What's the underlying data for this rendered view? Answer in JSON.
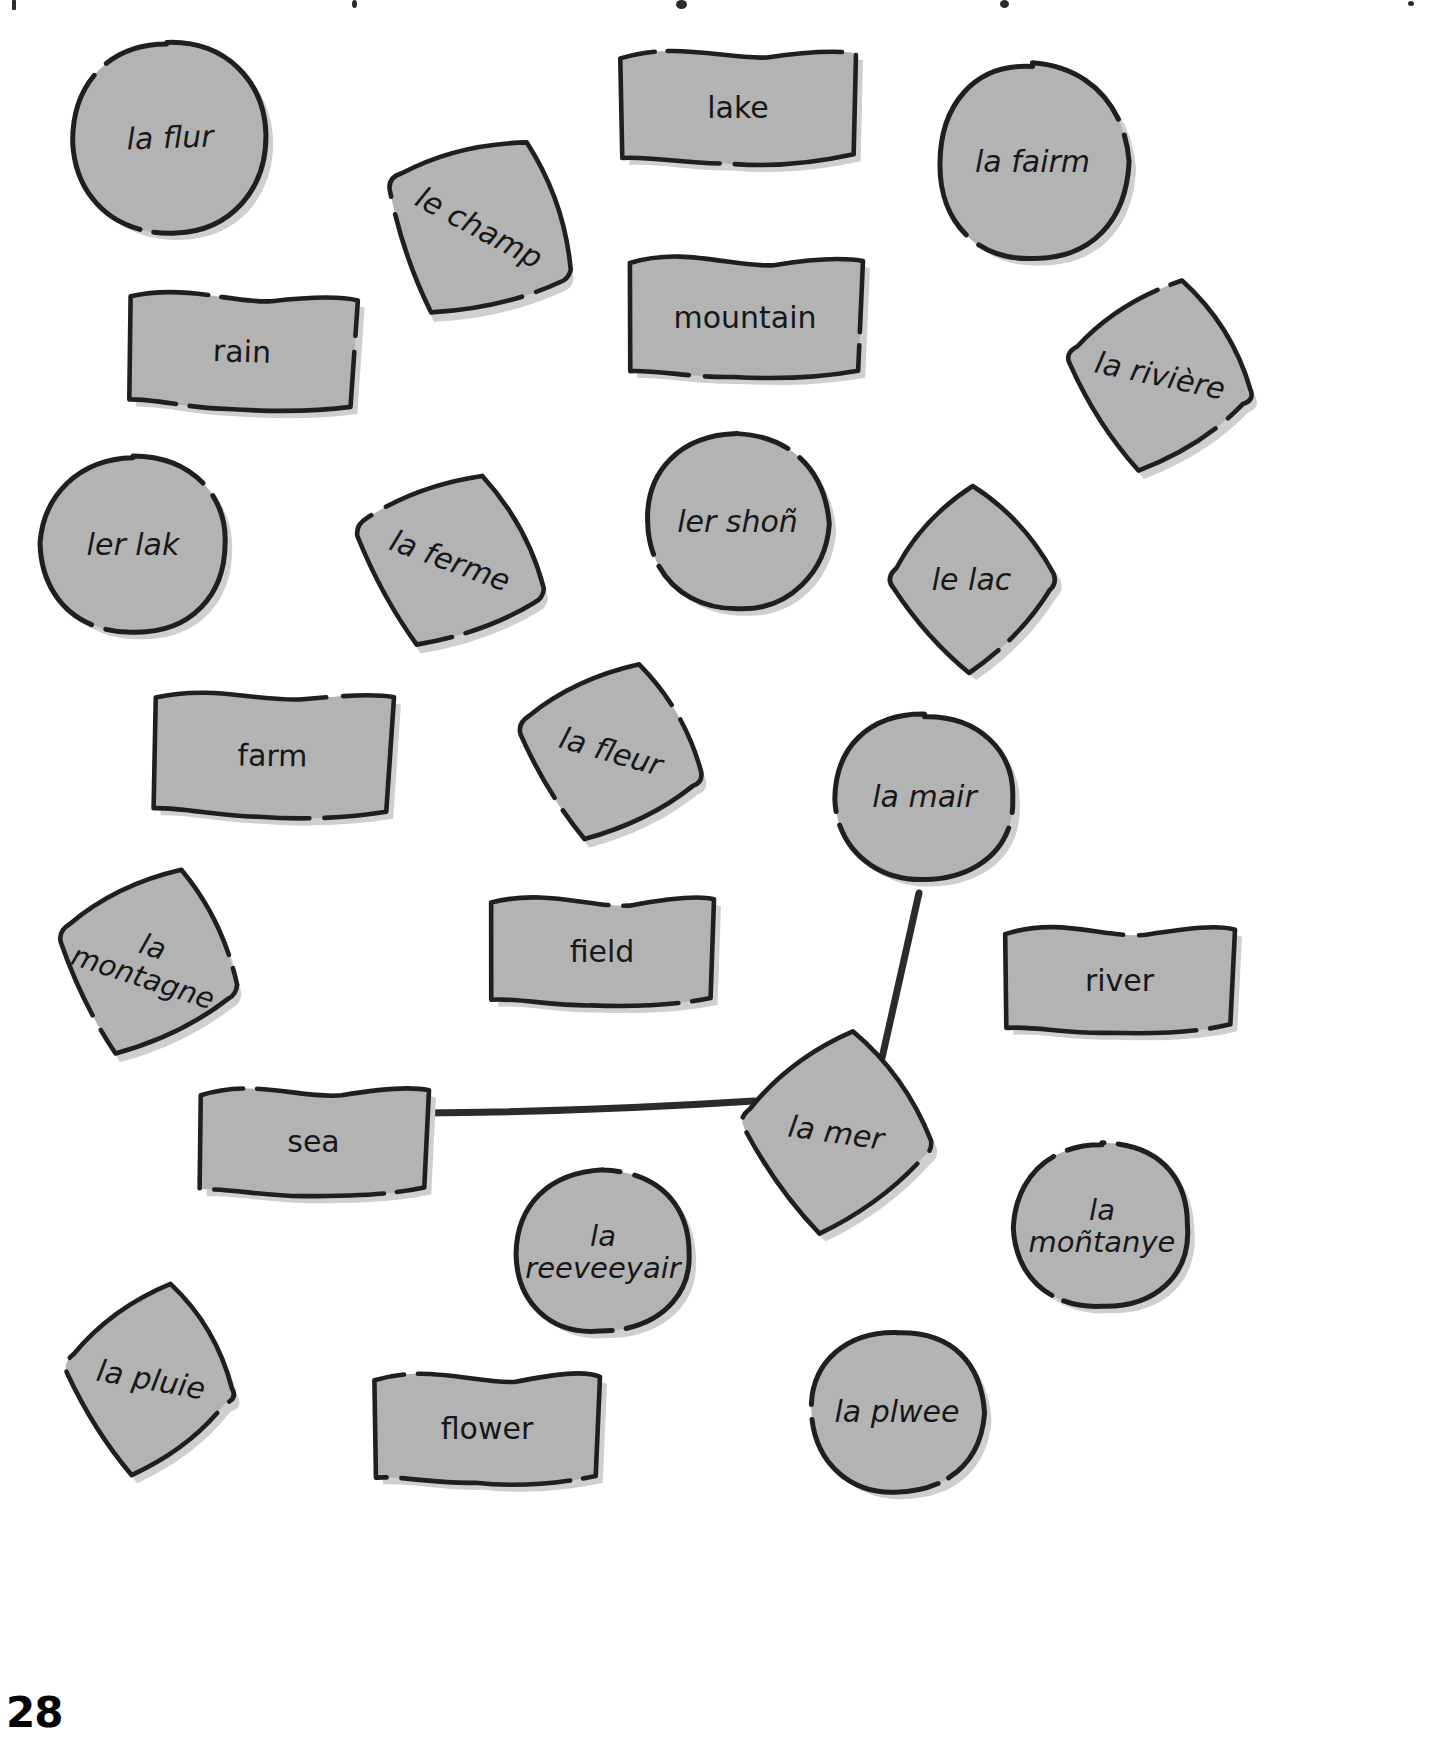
{
  "page": {
    "number": "28",
    "background_color": "#ffffff",
    "shape_fill": "#b3b3b3",
    "shape_stroke": "#1f1f1f",
    "shape_shadow": "#cfcfcf",
    "text_color": "#17171a",
    "link_color": "#2b2b2b"
  },
  "cards": [
    {
      "id": "la-flur",
      "label": "la flur",
      "lang": "fr",
      "shape": "circle",
      "x": 70,
      "y": 40,
      "w": 200,
      "h": 195,
      "rot": -2,
      "font": 30,
      "lines": 1
    },
    {
      "id": "lake",
      "label": "lake",
      "lang": "en",
      "shape": "flag",
      "x": 618,
      "y": 45,
      "w": 240,
      "h": 125,
      "rot": 0,
      "font": 30,
      "lines": 1
    },
    {
      "id": "la-fairm",
      "label": "la fairm",
      "lang": "fr",
      "shape": "circle",
      "x": 935,
      "y": 62,
      "w": 195,
      "h": 200,
      "rot": 0,
      "font": 30,
      "lines": 1
    },
    {
      "id": "le-champ",
      "label": "le champ",
      "lang": "fr",
      "shape": "diamond",
      "x": 374,
      "y": 128,
      "w": 210,
      "h": 200,
      "rot": 28,
      "font": 30,
      "lines": 1
    },
    {
      "id": "rain",
      "label": "rain",
      "lang": "en",
      "shape": "flag",
      "x": 126,
      "y": 288,
      "w": 232,
      "h": 128,
      "rot": 2,
      "font": 30,
      "lines": 1
    },
    {
      "id": "mountain",
      "label": "mountain",
      "lang": "en",
      "shape": "flag",
      "x": 625,
      "y": 252,
      "w": 240,
      "h": 132,
      "rot": 0,
      "font": 30,
      "lines": 1
    },
    {
      "id": "la-riviere",
      "label": "la rivière",
      "lang": "fr",
      "shape": "diamond",
      "x": 1060,
      "y": 276,
      "w": 200,
      "h": 200,
      "rot": 12,
      "font": 30,
      "lines": 1
    },
    {
      "id": "ler-lak",
      "label": "ler lak",
      "lang": "fr",
      "shape": "circle",
      "x": 38,
      "y": 455,
      "w": 190,
      "h": 180,
      "rot": 0,
      "font": 30,
      "lines": 1
    },
    {
      "id": "la-ferme",
      "label": "la ferme",
      "lang": "fr",
      "shape": "diamond",
      "x": 348,
      "y": 468,
      "w": 204,
      "h": 186,
      "rot": 20,
      "font": 30,
      "lines": 1
    },
    {
      "id": "ler-shon",
      "label": "ler shoñ",
      "lang": "fr",
      "shape": "circle",
      "x": 645,
      "y": 432,
      "w": 185,
      "h": 180,
      "rot": 0,
      "font": 30,
      "lines": 1
    },
    {
      "id": "le-lac",
      "label": "le lac",
      "lang": "fr",
      "shape": "diamond",
      "x": 884,
      "y": 484,
      "w": 175,
      "h": 192,
      "rot": 0,
      "font": 30,
      "lines": 1
    },
    {
      "id": "farm",
      "label": "farm",
      "lang": "en",
      "shape": "flag",
      "x": 150,
      "y": 688,
      "w": 245,
      "h": 135,
      "rot": 1,
      "font": 30,
      "lines": 1
    },
    {
      "id": "la-fleur",
      "label": "la fleur",
      "lang": "fr",
      "shape": "diamond",
      "x": 512,
      "y": 658,
      "w": 198,
      "h": 188,
      "rot": 16,
      "font": 30,
      "lines": 1
    },
    {
      "id": "la-mair",
      "label": "la mair",
      "lang": "fr",
      "shape": "circle",
      "x": 832,
      "y": 712,
      "w": 185,
      "h": 170,
      "rot": 0,
      "font": 30,
      "lines": 1
    },
    {
      "id": "la-montagne",
      "label": "la\nmontagne",
      "lang": "fr",
      "shape": "diamond",
      "x": 52,
      "y": 862,
      "w": 192,
      "h": 200,
      "rot": 18,
      "font": 29,
      "lines": 2
    },
    {
      "id": "field",
      "label": "field",
      "lang": "en",
      "shape": "flag",
      "x": 488,
      "y": 892,
      "w": 228,
      "h": 120,
      "rot": 0,
      "font": 30,
      "lines": 1
    },
    {
      "id": "river",
      "label": "river",
      "lang": "en",
      "shape": "flag",
      "x": 1002,
      "y": 922,
      "w": 235,
      "h": 118,
      "rot": 0,
      "font": 30,
      "lines": 1
    },
    {
      "id": "sea",
      "label": "sea",
      "lang": "en",
      "shape": "flag",
      "x": 196,
      "y": 1082,
      "w": 235,
      "h": 120,
      "rot": 0,
      "font": 30,
      "lines": 1
    },
    {
      "id": "la-mer",
      "label": "la mer",
      "lang": "fr",
      "shape": "diamond",
      "x": 736,
      "y": 1028,
      "w": 200,
      "h": 210,
      "rot": 8,
      "font": 30,
      "lines": 1
    },
    {
      "id": "la-montanye",
      "label": "la\nmoñtanye",
      "lang": "fr",
      "shape": "circle",
      "x": 1012,
      "y": 1142,
      "w": 180,
      "h": 168,
      "rot": 0,
      "font": 29,
      "lines": 2
    },
    {
      "id": "la-reeveeyair",
      "label": "la\nreeveeyair",
      "lang": "fr",
      "shape": "circle",
      "x": 512,
      "y": 1168,
      "w": 182,
      "h": 168,
      "rot": 0,
      "font": 29,
      "lines": 2
    },
    {
      "id": "la-pluie",
      "label": "la pluie",
      "lang": "fr",
      "shape": "diamond",
      "x": 60,
      "y": 1280,
      "w": 182,
      "h": 200,
      "rot": 10,
      "font": 30,
      "lines": 1
    },
    {
      "id": "la-plwee",
      "label": "la plwee",
      "lang": "fr",
      "shape": "circle",
      "x": 808,
      "y": 1328,
      "w": 178,
      "h": 168,
      "rot": 0,
      "font": 30,
      "lines": 1
    },
    {
      "id": "flower",
      "label": "flower",
      "lang": "en",
      "shape": "flag",
      "x": 372,
      "y": 1368,
      "w": 230,
      "h": 122,
      "rot": 0,
      "font": 30,
      "lines": 1
    }
  ],
  "connections": [
    {
      "id": "la-mair-to-la-mer",
      "from": "la-mair",
      "to": "la-mer",
      "x1": 919,
      "y1": 893,
      "x2": 882,
      "y2": 1058
    },
    {
      "id": "sea-to-la-mer",
      "from": "sea",
      "to": "la-mer",
      "x1": 420,
      "y1": 1113,
      "x2": 754,
      "y2": 1101
    }
  ]
}
